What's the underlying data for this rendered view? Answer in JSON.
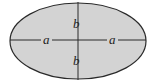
{
  "diagram": {
    "shape": "ellipse",
    "fill_color": "#d3d3d3",
    "stroke_color": "#2a2a2a",
    "labels": {
      "left_semi_major": "a",
      "right_semi_major": "a",
      "top_semi_minor": "b",
      "bottom_semi_minor": "b"
    }
  }
}
